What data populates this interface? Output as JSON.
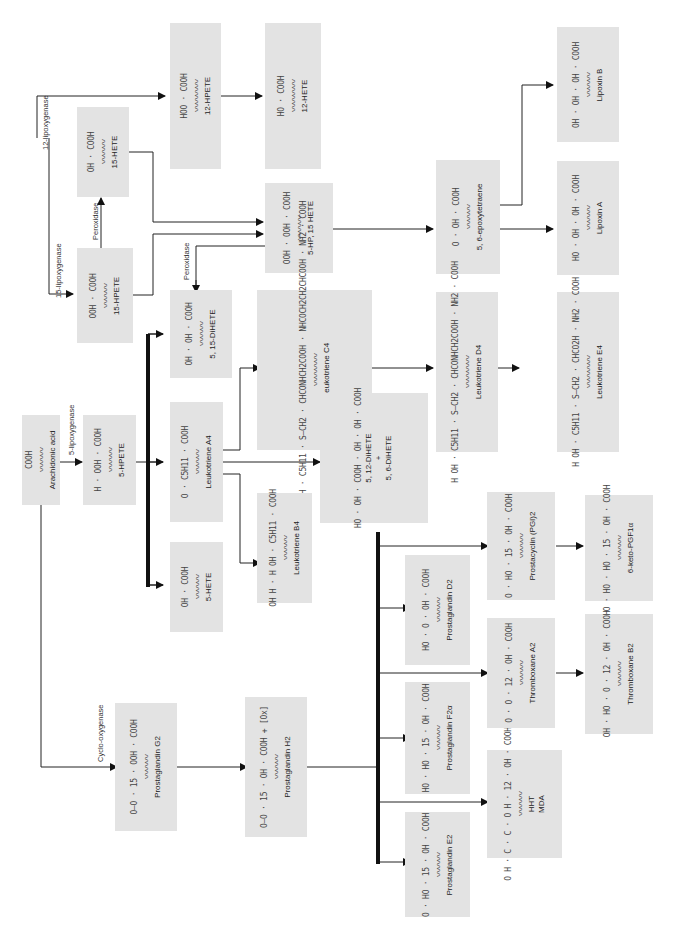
{
  "orientation": "rotated 90° counter-clockwise (text reads bottom to top)",
  "colors": {
    "box_fill": "#e3e3e3",
    "line": "#222222",
    "text": "#222222"
  },
  "compounds": {
    "arachidonic_acid": {
      "name": "Arachidonic acid",
      "groups": "COOH"
    },
    "hpete_5": {
      "name": "5-HPETE",
      "groups": "H · OOH · COOH"
    },
    "hete_5": {
      "name": "5-HETE",
      "groups": "OH · COOH"
    },
    "leukotriene_a4": {
      "name": "Leukotriene A4",
      "groups": "O · C5H11 · COOH"
    },
    "leukotriene_b4": {
      "name": "Leukotriene B4",
      "groups": "OH H · H OH · C5H11 · COOH"
    },
    "dihete_5_15": {
      "name": "5, 15-DiHETE",
      "groups": "OH · OH · COOH"
    },
    "hpete_15": {
      "name": "15-HPETE",
      "groups": "OOH · COOH"
    },
    "hete_15": {
      "name": "15-HETE",
      "groups": "OH · COOH"
    },
    "hp_5_15_hete": {
      "name": "5-HP, 15 HETE",
      "groups": "OOH · OOH · COOH"
    },
    "hpete_12": {
      "name": "12-HPETE",
      "groups": "HOO · COOH"
    },
    "hete_12": {
      "name": "12-HETE",
      "groups": "HO · COOH"
    },
    "epoxytetraene": {
      "name": "5, 6-epoxytetraene",
      "groups": "O · OH · COOH"
    },
    "lipoxin_a": {
      "name": "Lipoxin A",
      "groups": "HO · OH · OH · COOH"
    },
    "lipoxin_b": {
      "name": "Lipoxin B",
      "groups": "OH · OH · OH · COOH"
    },
    "leukotriene_c4": {
      "name": "Leukotriene C4",
      "groups": "H OH · H OH · C5H11 · S—CH2 · CHCONHCH2COOH · NHCOCH2CH2CHCOOH · NH2 · COOH"
    },
    "leukotriene_d4": {
      "name": "Leukotriene D4",
      "groups": "H OH · C5H11 · S—CH2 · CHCONHCH2COOH · NH2 · COOH"
    },
    "leukotriene_e4": {
      "name": "Leukotriene E4",
      "groups": "H OH · C5H11 · S—CH2 · CHCO2H · NH2 · COOH"
    },
    "dihete_5_12": {
      "name": "5, 12-DiHETE",
      "plus": "+",
      "name2": "5, 6-DiHETE",
      "groups": "HO · OH · COOH · OH · OH · COOH"
    },
    "prostaglandin_g2": {
      "name": "Prostaglandin G2",
      "groups": "O—O · 15 · OOH · COOH"
    },
    "prostaglandin_h2": {
      "name": "Prostaglandin H2",
      "groups": "O—O · 15 · OH · COOH + [Ox]"
    },
    "prostaglandin_e2": {
      "name": "Prostaglandin E2",
      "groups": "O · HO · 15 · OH · COOH"
    },
    "prostaglandin_f2a": {
      "name": "Prostaglandin F2α",
      "groups": "HO · HO · 15 · OH · COOH"
    },
    "prostaglandin_d2": {
      "name": "Prostaglandin D2",
      "groups": "HO · O · OH · COOH"
    },
    "hht": {
      "name": "HHT",
      "name2": "MDA",
      "groups": "O H · C · C · O H · 12 · OH · COOH"
    },
    "thromboxane_a2": {
      "name": "Thromboxane A2",
      "groups": "O · O · 12 · OH · COOH"
    },
    "thromboxane_b2": {
      "name": "Thromboxane B2",
      "groups": "OH · HO · O · 12 · OH · COOH"
    },
    "prostacyclin": {
      "name": "Prostacyclin (PGI)2",
      "groups": "O · HO · 15 · OH · COOH"
    },
    "keto_pgf1a": {
      "name": "6-keto-PGF1α",
      "groups": "O · HO · HO · 15 · OH · COOH"
    }
  },
  "enzymes": {
    "lipoxygenase_12": "12-lipoxygenase",
    "lipoxygenase_15": "15-lipoxygenase",
    "lipoxygenase_5": "5-lipoxygenase",
    "peroxidase_a": "Peroxidase",
    "peroxidase_b": "Peroxidase",
    "cyclooxygenase": "Cyclo-oxygenase"
  }
}
